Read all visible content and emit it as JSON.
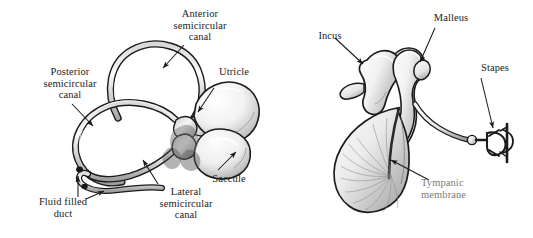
{
  "figure": {
    "background_color": "#ffffff",
    "ink_color": "#1b1b1b",
    "soft_label_color": "#7b7b7b"
  },
  "panels": [
    {
      "id": "vestibular",
      "name": "Vestibular apparatus",
      "labels": [
        {
          "id": "anterior",
          "text": "Anterior\nsemicircular\ncanal"
        },
        {
          "id": "posterior",
          "text": "Posterior\nsemicircular\ncanal"
        },
        {
          "id": "utricle",
          "text": "Utricle"
        },
        {
          "id": "saccule",
          "text": "Saccule"
        },
        {
          "id": "lateral",
          "text": "Lateral\nsemicircular\ncanal"
        },
        {
          "id": "fluid",
          "text": "Fluid filled\nduct"
        }
      ]
    },
    {
      "id": "ossicles",
      "name": "Middle ear ossicles and eardrum",
      "labels": [
        {
          "id": "incus",
          "text": "Incus"
        },
        {
          "id": "malleus",
          "text": "Malleus"
        },
        {
          "id": "stapes",
          "text": "Stapes"
        },
        {
          "id": "tympanic",
          "text": "Tympanic\nmembrane"
        }
      ]
    }
  ]
}
